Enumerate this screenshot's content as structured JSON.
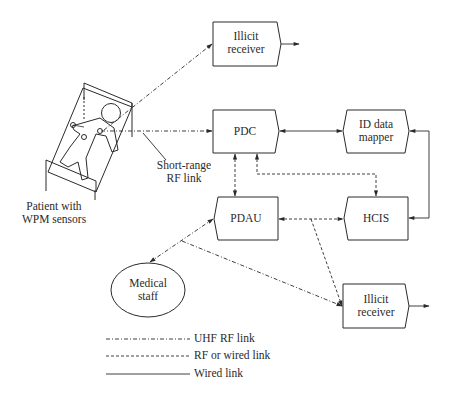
{
  "diagram": {
    "nodes": {
      "illicit_receiver_top": {
        "line1": "Illicit",
        "line2": "receiver"
      },
      "pdc": {
        "label": "PDC"
      },
      "id_data_mapper": {
        "line1": "ID data",
        "line2": "mapper"
      },
      "pdau": {
        "label": "PDAU"
      },
      "hcis": {
        "label": "HCIS"
      },
      "illicit_receiver_bottom": {
        "line1": "Illicit",
        "line2": "receiver"
      },
      "medical_staff": {
        "line1": "Medical",
        "line2": "staff"
      },
      "patient": {
        "line1": "Patient with",
        "line2": "WPM sensors"
      }
    },
    "annotations": {
      "short_range": {
        "line1": "Short-range",
        "line2": "RF link"
      }
    },
    "edges": [
      {
        "from": "patient",
        "to": "illicit_receiver_top",
        "type": "UHF RF link",
        "direction": "one-way"
      },
      {
        "from": "patient",
        "to": "pdc",
        "type": "UHF RF link",
        "direction": "one-way"
      },
      {
        "from": "pdc",
        "to": "id_data_mapper",
        "type": "Wired link",
        "direction": "two-way"
      },
      {
        "from": "pdc",
        "to": "pdau",
        "type": "RF or wired link",
        "direction": "two-way"
      },
      {
        "from": "pdc",
        "to": "hcis",
        "type": "RF or wired link",
        "direction": "two-way"
      },
      {
        "from": "id_data_mapper",
        "to": "hcis",
        "type": "Wired link",
        "direction": "two-way"
      },
      {
        "from": "pdau",
        "to": "hcis",
        "type": "RF or wired link",
        "direction": "two-way"
      },
      {
        "from": "medical_staff",
        "to": "pdau",
        "type": "UHF RF link",
        "direction": "two-way"
      },
      {
        "from": "pdau-hcis link",
        "to": "illicit_receiver_bottom",
        "type": "RF or wired link",
        "direction": "one-way"
      },
      {
        "from": "medical_staff-pdau link",
        "to": "illicit_receiver_bottom",
        "type": "UHF RF link",
        "direction": "one-way"
      }
    ],
    "legend": [
      {
        "style": "dash-dot",
        "label": "UHF RF link"
      },
      {
        "style": "dashed",
        "label": "RF or wired link"
      },
      {
        "style": "solid",
        "label": "Wired link"
      }
    ],
    "colors": {
      "stroke": "#2a2a2a",
      "background": "#ffffff"
    }
  }
}
